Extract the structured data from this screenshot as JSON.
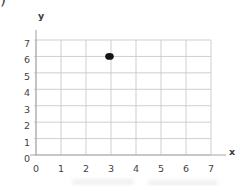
{
  "page": {
    "corner_mark": ")"
  },
  "chart_data": {
    "type": "scatter",
    "title": "",
    "xlabel": "x",
    "ylabel": "y",
    "xlim": [
      0,
      7
    ],
    "ylim": [
      0,
      7
    ],
    "x_ticks": [
      0,
      1,
      2,
      3,
      4,
      5,
      6,
      7
    ],
    "y_ticks": [
      0,
      1,
      2,
      3,
      4,
      5,
      6,
      7
    ],
    "grid": true,
    "legend": false,
    "points": [
      {
        "x": 3,
        "y": 6
      }
    ],
    "colors": {
      "background": "#ffffff",
      "gridline": "#c9c9c9",
      "axis": "#a8a8a8",
      "tick_label": "#3f3f3f",
      "point": "#141414"
    }
  }
}
